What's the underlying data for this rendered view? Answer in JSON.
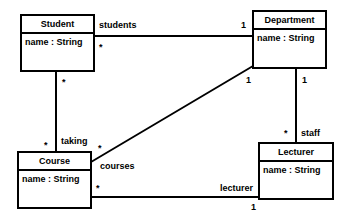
{
  "diagram": {
    "type": "UML class diagram",
    "classes": [
      {
        "id": "student",
        "name": "Student",
        "attributes": [
          "name : String"
        ]
      },
      {
        "id": "department",
        "name": "Department",
        "attributes": [
          "name : String"
        ]
      },
      {
        "id": "course",
        "name": "Course",
        "attributes": [
          "name : String"
        ]
      },
      {
        "id": "lecturer",
        "name": "Lecturer",
        "attributes": [
          "name : String"
        ]
      }
    ],
    "associations": [
      {
        "from": "Student",
        "to": "Department",
        "role": "students",
        "from_mult": "*",
        "to_mult": "1"
      },
      {
        "from": "Student",
        "to": "Course",
        "role": "taking",
        "from_mult": "*",
        "to_mult": "*"
      },
      {
        "from": "Department",
        "to": "Course",
        "role": "courses",
        "from_mult": "1",
        "to_mult": "*"
      },
      {
        "from": "Department",
        "to": "Lecturer",
        "role": "staff",
        "from_mult": "1",
        "to_mult": "*"
      },
      {
        "from": "Course",
        "to": "Lecturer",
        "role": "lecturer",
        "from_mult": "*",
        "to_mult": "1"
      }
    ],
    "labels": {
      "students": "students",
      "taking": "taking",
      "courses": "courses",
      "staff": "staff",
      "lecturer": "lecturer",
      "many": "*",
      "one": "1"
    }
  }
}
